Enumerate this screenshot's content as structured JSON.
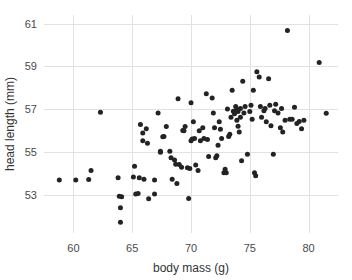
{
  "chart_data": {
    "type": "scatter",
    "title": "",
    "xlabel": "body mass (g)",
    "ylabel": "head length (mm)",
    "xlim": [
      57.5,
      82.5
    ],
    "ylim": [
      51.2,
      61.4
    ],
    "xticks": [
      60,
      65,
      70,
      75,
      80
    ],
    "yticks": [
      53,
      55,
      57,
      59,
      61
    ],
    "grid": true,
    "legend": null,
    "marker": {
      "color": "#232323",
      "radius": 2.5,
      "shape": "circle"
    },
    "n_points": 126,
    "points": [
      [
        58.8,
        53.68
      ],
      [
        60.2,
        53.68
      ],
      [
        61.3,
        53.7
      ],
      [
        61.5,
        54.12
      ],
      [
        62.3,
        56.85
      ],
      [
        63.8,
        53.78
      ],
      [
        63.9,
        52.92
      ],
      [
        64.1,
        52.9
      ],
      [
        64.0,
        52.38
      ],
      [
        64.0,
        51.7
      ],
      [
        65.1,
        53.82
      ],
      [
        65.2,
        54.32
      ],
      [
        65.3,
        53.02
      ],
      [
        65.5,
        53.05
      ],
      [
        65.6,
        53.78
      ],
      [
        65.7,
        56.28
      ],
      [
        65.9,
        55.52
      ],
      [
        65.9,
        55.88
      ],
      [
        66.0,
        53.72
      ],
      [
        66.2,
        56.08
      ],
      [
        66.3,
        55.4
      ],
      [
        66.4,
        52.8
      ],
      [
        66.9,
        53.68
      ],
      [
        66.9,
        53.02
      ],
      [
        67.2,
        56.82
      ],
      [
        67.4,
        54.98
      ],
      [
        67.4,
        55.02
      ],
      [
        67.6,
        55.7
      ],
      [
        67.7,
        55.72
      ],
      [
        67.9,
        56.18
      ],
      [
        68.2,
        55.02
      ],
      [
        68.3,
        54.72
      ],
      [
        68.4,
        53.72
      ],
      [
        68.6,
        54.62
      ],
      [
        68.7,
        54.42
      ],
      [
        68.8,
        53.52
      ],
      [
        68.9,
        57.48
      ],
      [
        69.0,
        54.4
      ],
      [
        69.2,
        54.28
      ],
      [
        69.3,
        56.0
      ],
      [
        69.4,
        55.98
      ],
      [
        69.5,
        56.18
      ],
      [
        69.7,
        54.25
      ],
      [
        69.8,
        52.82
      ],
      [
        69.9,
        54.22
      ],
      [
        70.0,
        57.3
      ],
      [
        70.0,
        55.52
      ],
      [
        70.1,
        55.6
      ],
      [
        70.2,
        56.4
      ],
      [
        70.3,
        55.62
      ],
      [
        70.4,
        54.38
      ],
      [
        70.6,
        54.12
      ],
      [
        70.7,
        55.98
      ],
      [
        70.8,
        55.52
      ],
      [
        71.0,
        56.12
      ],
      [
        71.1,
        55.62
      ],
      [
        71.3,
        57.72
      ],
      [
        71.4,
        55.58
      ],
      [
        71.5,
        54.78
      ],
      [
        71.8,
        57.52
      ],
      [
        71.9,
        56.82
      ],
      [
        72.0,
        56.12
      ],
      [
        72.1,
        54.72
      ],
      [
        72.2,
        54.82
      ],
      [
        72.3,
        55.3
      ],
      [
        72.4,
        56.4
      ],
      [
        72.5,
        56.05
      ],
      [
        72.6,
        55.62
      ],
      [
        72.8,
        54.02
      ],
      [
        72.9,
        54.18
      ],
      [
        73.0,
        54.02
      ],
      [
        73.1,
        57.0
      ],
      [
        73.2,
        55.72
      ],
      [
        73.3,
        55.82
      ],
      [
        73.4,
        56.62
      ],
      [
        73.5,
        57.88
      ],
      [
        73.6,
        56.9
      ],
      [
        73.7,
        56.78
      ],
      [
        73.8,
        57.12
      ],
      [
        73.9,
        56.98
      ],
      [
        73.9,
        56.48
      ],
      [
        74.0,
        56.88
      ],
      [
        74.0,
        56.2
      ],
      [
        74.1,
        55.92
      ],
      [
        74.2,
        57.02
      ],
      [
        74.2,
        56.62
      ],
      [
        74.3,
        54.58
      ],
      [
        74.4,
        58.3
      ],
      [
        74.5,
        56.82
      ],
      [
        74.6,
        57.12
      ],
      [
        74.8,
        54.88
      ],
      [
        75.0,
        56.88
      ],
      [
        75.1,
        57.18
      ],
      [
        75.2,
        56.52
      ],
      [
        75.3,
        57.88
      ],
      [
        75.4,
        54.02
      ],
      [
        75.5,
        53.88
      ],
      [
        75.6,
        58.75
      ],
      [
        75.8,
        58.5
      ],
      [
        75.9,
        57.12
      ],
      [
        76.0,
        56.62
      ],
      [
        76.2,
        56.92
      ],
      [
        76.3,
        57.02
      ],
      [
        76.4,
        56.4
      ],
      [
        76.6,
        58.42
      ],
      [
        76.7,
        57.18
      ],
      [
        76.8,
        56.22
      ],
      [
        77.0,
        54.88
      ],
      [
        77.1,
        56.92
      ],
      [
        77.2,
        57.22
      ],
      [
        77.4,
        56.82
      ],
      [
        77.6,
        56.12
      ],
      [
        77.7,
        57.02
      ],
      [
        77.8,
        55.92
      ],
      [
        78.0,
        56.48
      ],
      [
        78.2,
        60.68
      ],
      [
        78.4,
        56.52
      ],
      [
        78.6,
        56.52
      ],
      [
        78.8,
        57.08
      ],
      [
        79.0,
        56.32
      ],
      [
        79.2,
        56.42
      ],
      [
        79.4,
        56.08
      ],
      [
        79.6,
        56.48
      ],
      [
        80.9,
        59.18
      ],
      [
        81.5,
        56.8
      ]
    ]
  },
  "axes": {
    "x_tick_labels": [
      "60",
      "65",
      "70",
      "75",
      "80"
    ],
    "y_tick_labels": [
      "53",
      "55",
      "57",
      "59",
      "61"
    ],
    "x_axis_title": "body mass (g)",
    "y_axis_title": "head length (mm)"
  },
  "geometry": {
    "plot_left": 44,
    "plot_right": 338,
    "plot_top": 15,
    "plot_bottom": 233,
    "x_data_min": 57.5,
    "x_data_max": 82.5,
    "y_data_min": 51.2,
    "y_data_max": 61.4
  }
}
